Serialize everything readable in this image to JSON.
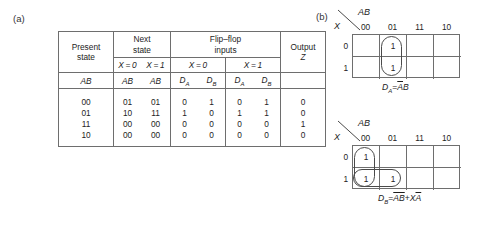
{
  "figure": {
    "panel_a_label": "(a)",
    "panel_b_label": "(b)"
  },
  "state_table": {
    "headers": {
      "present_state": "Present state",
      "present_state_line1": "Present",
      "present_state_line2": "state",
      "next_state_line1": "Next",
      "next_state_line2": "state",
      "flipflop_line1": "Flip–flop",
      "flipflop_line2": "inputs",
      "output_line1": "Output",
      "output_line2": "Z",
      "next_x0": "X = 0",
      "next_x1": "X = 1",
      "ff_x0": "X = 0",
      "ff_x1": "X = 1",
      "sub_present_ab": "AB",
      "sub_next_ab_x0": "AB",
      "sub_next_ab_x1": "AB",
      "sub_da_x0": "D",
      "sub_da_x0_sub": "A",
      "sub_db_x0": "D",
      "sub_db_x0_sub": "B",
      "sub_da_x1": "D",
      "sub_da_x1_sub": "A",
      "sub_db_x1": "D",
      "sub_db_x1_sub": "B"
    },
    "rows": [
      {
        "present": "00",
        "next_x0": "01",
        "next_x1": "01",
        "da_x0": "0",
        "db_x0": "1",
        "da_x1": "0",
        "db_x1": "1",
        "z": "0"
      },
      {
        "present": "01",
        "next_x0": "10",
        "next_x1": "11",
        "da_x0": "1",
        "db_x0": "0",
        "da_x1": "1",
        "db_x1": "1",
        "z": "0"
      },
      {
        "present": "11",
        "next_x0": "00",
        "next_x1": "00",
        "da_x0": "0",
        "db_x0": "0",
        "da_x1": "0",
        "db_x1": "0",
        "z": "1"
      },
      {
        "present": "10",
        "next_x0": "00",
        "next_x1": "00",
        "da_x0": "0",
        "db_x0": "0",
        "da_x1": "0",
        "db_x1": "0",
        "z": "0"
      }
    ]
  },
  "kmaps": [
    {
      "name": "da-kmap",
      "corner_ab": "AB",
      "corner_x": "X",
      "col_labels": [
        "00",
        "01",
        "11",
        "10"
      ],
      "row_labels": [
        "0",
        "1"
      ],
      "cells": [
        [
          "",
          "1",
          "",
          ""
        ],
        [
          "",
          "1",
          "",
          ""
        ]
      ],
      "equation_lhs": "D",
      "equation_lhs_sub": "A",
      "equation_eq": "=",
      "equation_rhs_parts": [
        {
          "text": "A",
          "overline": true
        },
        {
          "text": "B",
          "overline": false
        }
      ],
      "equation_plain": "D_A = ĀB"
    },
    {
      "name": "db-kmap",
      "corner_ab": "AB",
      "corner_x": "X",
      "col_labels": [
        "00",
        "01",
        "11",
        "10"
      ],
      "row_labels": [
        "0",
        "1"
      ],
      "cells": [
        [
          "1",
          "",
          "",
          ""
        ],
        [
          "1",
          "1",
          "",
          ""
        ]
      ],
      "equation_lhs": "D",
      "equation_lhs_sub": "B",
      "equation_eq": "=",
      "equation_rhs_parts": [
        {
          "text": "A",
          "overline": true
        },
        {
          "text": "B",
          "overline": true
        },
        {
          "text": "+",
          "overline": false
        },
        {
          "text": "X",
          "overline": false
        },
        {
          "text": "A",
          "overline": true
        }
      ],
      "equation_plain": "D_B = ĀB̄ + XĀ"
    }
  ],
  "colors": {
    "line": "#6e6e6e",
    "loop": "#4a4a4a",
    "text": "#1d1d1d",
    "background": "#ffffff"
  }
}
